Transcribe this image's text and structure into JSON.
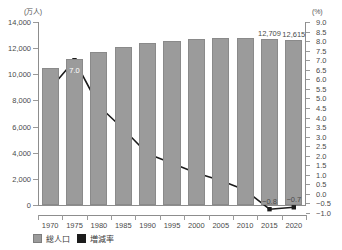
{
  "axes": {
    "left_unit": "(万人)",
    "right_unit": "(%)",
    "left_ticks": [
      "14,000",
      "12,000",
      "10,000",
      "8,000",
      "6,000",
      "4,000",
      "2,000",
      "0"
    ],
    "right_ticks": [
      "9.0",
      "8.5",
      "8.0",
      "7.5",
      "7.0",
      "6.5",
      "6.0",
      "5.5",
      "5.0",
      "4.5",
      "4.0",
      "3.5",
      "3.0",
      "2.5",
      "2.0",
      "1.5",
      "1.0",
      "0.5",
      "0.0",
      "−0.5",
      "−1.0"
    ]
  },
  "legend": {
    "items": [
      {
        "label": "総人口",
        "color": "#9b9b9b"
      },
      {
        "label": "増減率",
        "color": "#1c1c1c"
      }
    ]
  },
  "chart_data": {
    "type": "bar",
    "title": "",
    "xlabel": "",
    "ylabel": "(万人)",
    "y2label": "(%)",
    "grid": false,
    "legend_position": "bottom-left",
    "categories": [
      "1970",
      "1975",
      "1980",
      "1985",
      "1990",
      "1995",
      "2000",
      "2005",
      "2010",
      "2015",
      "2020"
    ],
    "ylim": [
      0,
      14000
    ],
    "y2lim": [
      -1.0,
      9.0
    ],
    "series": [
      {
        "name": "総人口",
        "type": "bar",
        "axis": "left",
        "color": "#9b9b9b",
        "values": [
          10467,
          11194,
          11706,
          12105,
          12361,
          12557,
          12693,
          12777,
          12806,
          12709,
          12615
        ],
        "data_labels": [
          null,
          null,
          null,
          null,
          null,
          null,
          null,
          null,
          null,
          "12,709",
          "12,615"
        ]
      },
      {
        "name": "増減率",
        "type": "line",
        "axis": "right",
        "color": "#1c1c1c",
        "values": [
          5.5,
          7.0,
          4.6,
          3.4,
          2.1,
          1.6,
          1.1,
          0.7,
          0.2,
          -0.8,
          -0.7
        ],
        "data_labels": [
          null,
          "7.0",
          null,
          null,
          null,
          null,
          null,
          null,
          null,
          "−0.8",
          "−0.7"
        ]
      }
    ]
  }
}
